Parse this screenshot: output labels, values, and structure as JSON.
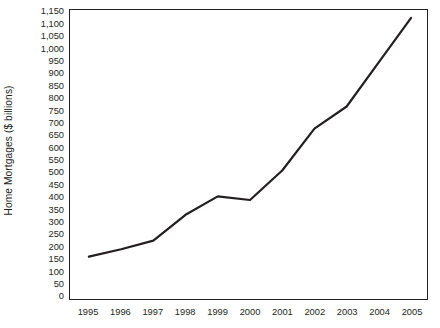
{
  "figure": {
    "title_sliver": "",
    "background_color": "#ffffff",
    "line_color": "#231f20",
    "frame_color": "#231f20"
  },
  "chart_data": {
    "type": "line",
    "title": "",
    "xlabel": "",
    "ylabel": "Home Mortgages ($ billions)",
    "categories": [
      "1995",
      "1996",
      "1997",
      "1998",
      "1999",
      "2000",
      "2001",
      "2002",
      "2003",
      "2004",
      "2005"
    ],
    "values": [
      160,
      190,
      225,
      330,
      405,
      390,
      510,
      680,
      770,
      950,
      1130
    ],
    "series": [
      {
        "name": "Home Mortgages",
        "values": [
          160,
          190,
          225,
          330,
          405,
          390,
          510,
          680,
          770,
          950,
          1130
        ]
      }
    ],
    "ylim": [
      0,
      1150
    ],
    "ytick_step": 50,
    "ytick_labels": [
      "1,150",
      "1,100",
      "1,050",
      "1,000",
      "950",
      "900",
      "850",
      "800",
      "750",
      "700",
      "650",
      "600",
      "550",
      "500",
      "450",
      "400",
      "350",
      "300",
      "250",
      "200",
      "150",
      "100",
      "50",
      "0"
    ],
    "ytick_values": [
      1150,
      1100,
      1050,
      1000,
      950,
      900,
      850,
      800,
      750,
      700,
      650,
      600,
      550,
      500,
      450,
      400,
      350,
      300,
      250,
      200,
      150,
      100,
      50,
      0
    ],
    "xtick_labels": [
      "1995",
      "1996",
      "1997",
      "1998",
      "1999",
      "2000",
      "2001",
      "2002",
      "2003",
      "2004",
      "2005"
    ],
    "grid": false,
    "legend": null,
    "legend_position": "none",
    "annotations": []
  }
}
